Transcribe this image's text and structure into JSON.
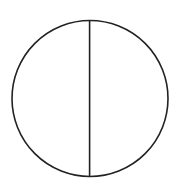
{
  "diagram": {
    "type": "circle-divided-vertically",
    "background": "#ffffff",
    "stroke_color": "#222222",
    "stroke_width": 1.6,
    "circle": {
      "cx": 90,
      "cy": 98.5,
      "r": 78
    },
    "divider": {
      "x": 89.6,
      "y1": 20.5,
      "y2": 176.5
    }
  }
}
